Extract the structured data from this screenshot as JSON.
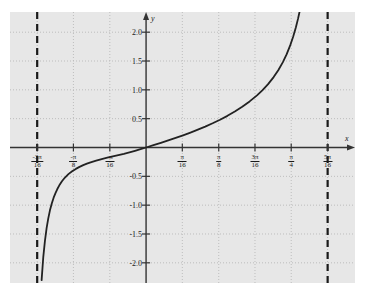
{
  "figure": {
    "background_color": "#e7e7e7",
    "page_color": "#ffffff",
    "axis_color": "#333333",
    "curve_color": "#222222",
    "grid_color": "#bdbdbd",
    "asymptote_color": "#1a1a1a"
  },
  "axes": {
    "x_axis_label": "x",
    "y_axis_label": "y"
  },
  "chart_data": {
    "type": "line",
    "title": "",
    "xlabel": "x",
    "ylabel": "y",
    "grid": true,
    "grid_style": "dotted",
    "legend": "none",
    "xlim": [
      -0.736,
      1.13
    ],
    "ylim": [
      -2.35,
      2.35
    ],
    "x_tick_values": [
      -0.589,
      -0.393,
      -0.196,
      0.196,
      0.393,
      0.589,
      0.785,
      0.982
    ],
    "x_tick_labels": [
      {
        "num": "-3π",
        "den": "16"
      },
      {
        "num": "-π",
        "den": "8"
      },
      {
        "num": "-π",
        "den": "16"
      },
      {
        "num": "π",
        "den": "16"
      },
      {
        "num": "π",
        "den": "8"
      },
      {
        "num": "3π",
        "den": "16"
      },
      {
        "num": "π",
        "den": "4"
      },
      {
        "num": "5π",
        "den": "16"
      }
    ],
    "y_tick_values": [
      2.0,
      1.5,
      1.0,
      0.5,
      -0.5,
      -1.0,
      -1.5,
      -2.0
    ],
    "y_tick_labels": [
      "2.0",
      "1.5",
      "1.0",
      "0.5",
      "-0.5",
      "-1.0",
      "-1.5",
      "-2.0"
    ],
    "asymptotes": [
      {
        "x": -0.589,
        "label": "-3π/16",
        "style": "dashed"
      },
      {
        "x": 0.982,
        "label": "5π/16",
        "style": "dashed"
      }
    ],
    "series": [
      {
        "name": "curve",
        "style": "solid",
        "points": [
          [
            -0.565,
            -2.3
          ],
          [
            -0.556,
            -1.9
          ],
          [
            -0.547,
            -1.62
          ],
          [
            -0.538,
            -1.4
          ],
          [
            -0.529,
            -1.23
          ],
          [
            -0.52,
            -1.09
          ],
          [
            -0.51,
            -0.97
          ],
          [
            -0.5,
            -0.87
          ],
          [
            -0.49,
            -0.79
          ],
          [
            -0.48,
            -0.72
          ],
          [
            -0.47,
            -0.66
          ],
          [
            -0.455,
            -0.585
          ],
          [
            -0.44,
            -0.525
          ],
          [
            -0.42,
            -0.462
          ],
          [
            -0.4,
            -0.412
          ],
          [
            -0.38,
            -0.371
          ],
          [
            -0.36,
            -0.336
          ],
          [
            -0.34,
            -0.306
          ],
          [
            -0.32,
            -0.28
          ],
          [
            -0.3,
            -0.257
          ],
          [
            -0.27,
            -0.227
          ],
          [
            -0.24,
            -0.2
          ],
          [
            -0.21,
            -0.176
          ],
          [
            -0.18,
            -0.154
          ],
          [
            -0.15,
            -0.132
          ],
          [
            -0.12,
            -0.11
          ],
          [
            -0.09,
            -0.085
          ],
          [
            -0.06,
            -0.058
          ],
          [
            -0.03,
            -0.029
          ],
          [
            0.0,
            0.0
          ],
          [
            0.04,
            0.04
          ],
          [
            0.08,
            0.081
          ],
          [
            0.12,
            0.123
          ],
          [
            0.16,
            0.166
          ],
          [
            0.2,
            0.212
          ],
          [
            0.24,
            0.259
          ],
          [
            0.28,
            0.309
          ],
          [
            0.32,
            0.362
          ],
          [
            0.36,
            0.42
          ],
          [
            0.4,
            0.482
          ],
          [
            0.44,
            0.549
          ],
          [
            0.48,
            0.623
          ],
          [
            0.52,
            0.706
          ],
          [
            0.56,
            0.799
          ],
          [
            0.6,
            0.905
          ],
          [
            0.63,
            0.996
          ],
          [
            0.66,
            1.1
          ],
          [
            0.69,
            1.221
          ],
          [
            0.715,
            1.34
          ],
          [
            0.74,
            1.48
          ],
          [
            0.76,
            1.615
          ],
          [
            0.78,
            1.775
          ],
          [
            0.795,
            1.915
          ],
          [
            0.81,
            2.08
          ],
          [
            0.822,
            2.235
          ],
          [
            0.832,
            2.38
          ]
        ]
      }
    ]
  }
}
